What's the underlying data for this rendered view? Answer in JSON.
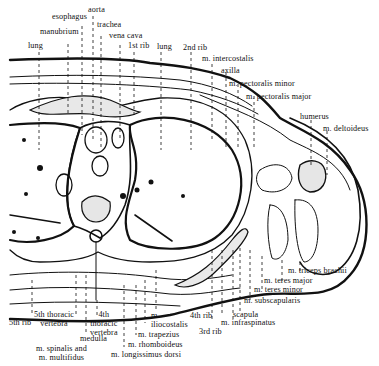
{
  "figure": {
    "labels_top": [
      {
        "id": "esophagus",
        "text": "esophagus"
      },
      {
        "id": "aorta",
        "text": "aorta"
      },
      {
        "id": "manubrium",
        "text": "manubrium"
      },
      {
        "id": "trachea",
        "text": "trachea"
      },
      {
        "id": "vena_cava",
        "text": "vena cava"
      },
      {
        "id": "lung_left",
        "text": "lung"
      },
      {
        "id": "first_rib",
        "text": "1st rib"
      },
      {
        "id": "lung_right",
        "text": "lung"
      },
      {
        "id": "second_rib",
        "text": "2nd rib"
      },
      {
        "id": "m_intercostalis",
        "text": "m. intercostalis"
      },
      {
        "id": "axilla",
        "text": "axilla"
      },
      {
        "id": "m_pectoralis_minor",
        "text": "m. pectoralis minor"
      },
      {
        "id": "m_pectoralis_major",
        "text": "m. pectoralis major"
      },
      {
        "id": "humerus",
        "text": "humerus"
      },
      {
        "id": "m_deltoideus",
        "text": "m. deltoideus"
      }
    ],
    "labels_bottom": [
      {
        "id": "m_triceps_brachii",
        "text": "m. triceps brachii"
      },
      {
        "id": "m_teres_major",
        "text": "m. teres major"
      },
      {
        "id": "m_teres_minor",
        "text": "m. teres minor"
      },
      {
        "id": "m_subscapularis",
        "text": "m. subscapularis"
      },
      {
        "id": "scapula",
        "text": "scapula"
      },
      {
        "id": "m_infraspinatus",
        "text": "m. infraspinatus"
      },
      {
        "id": "fourth_rib",
        "text": "4th rib"
      },
      {
        "id": "third_rib",
        "text": "3rd rib"
      },
      {
        "id": "fifth_rib",
        "text": "5th rib"
      },
      {
        "id": "fifth_thoracic_vertebra",
        "text": "5th thoracic\nvertebra"
      },
      {
        "id": "fourth_thoracic_vertebra",
        "text": "4th\nthoracic\nvertebra"
      },
      {
        "id": "medulla",
        "text": "medulla"
      },
      {
        "id": "m_spinalis_multifidus",
        "text": "m. spinalis and\nm. multifidus"
      },
      {
        "id": "m_iliocostalis",
        "text": "m.\niliocostalis"
      },
      {
        "id": "m_trapezius",
        "text": "m. trapezius"
      },
      {
        "id": "m_rhomboideus",
        "text": "m. rhomboideus"
      },
      {
        "id": "m_longissimus_dorsi",
        "text": "m. longissimus dorsi"
      }
    ]
  }
}
